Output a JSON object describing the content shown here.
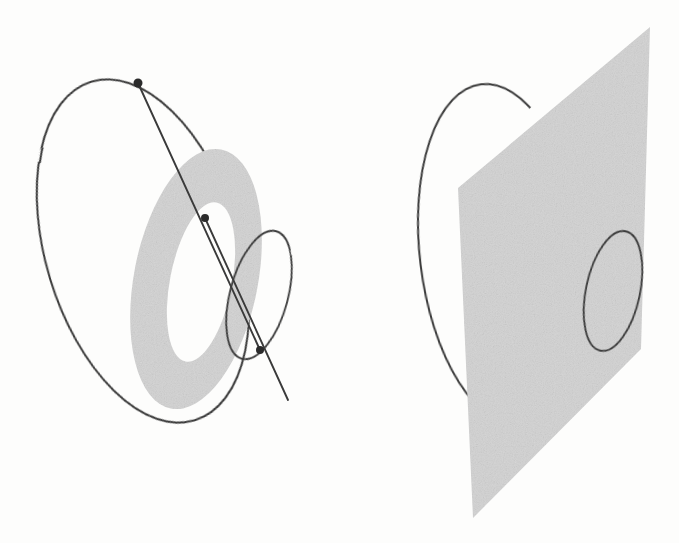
{
  "figure": {
    "background_color": "#fdfdfc",
    "stroke_color": "#3a3a3a",
    "fill_gray": "#d2d2d2",
    "fill_gray_edge": "#c9c9c9",
    "dot_color": "#2b2b2b",
    "canvas": {
      "width": 679,
      "height": 543
    }
  },
  "left_panel": {
    "label": "left-diagram",
    "outer_curve": {
      "name": "large-outer-ellipse",
      "cx": 143,
      "cy": 251,
      "rx": 97,
      "ry": 177,
      "rotation": -17,
      "stroke_width": 2.0
    },
    "annulus": {
      "name": "shaded-annulus",
      "outer": {
        "cx": 196,
        "cy": 279,
        "rx": 62,
        "ry": 132,
        "rotation": 11
      },
      "inner": {
        "cx": 201,
        "cy": 282,
        "rx": 31,
        "ry": 81,
        "rotation": 11
      },
      "fill": "#d2d2d2"
    },
    "small_ellipse": {
      "name": "small-right-ellipse",
      "cx": 259,
      "cy": 295,
      "rx": 29,
      "ry": 66,
      "rotation": 15,
      "stroke_width": 1.8
    },
    "chords": [
      {
        "name": "chord-upper",
        "x1": 138,
        "y1": 83,
        "x2": 260,
        "y2": 350
      },
      {
        "name": "chord-lower",
        "x1": 205,
        "y1": 218,
        "x2": 288,
        "y2": 400
      }
    ],
    "points": [
      {
        "name": "point-top",
        "cx": 138,
        "cy": 83,
        "r": 4.5
      },
      {
        "name": "point-center",
        "cx": 205,
        "cy": 218,
        "r": 4.0
      },
      {
        "name": "point-bottom-right",
        "cx": 260,
        "cy": 350,
        "r": 4.0
      }
    ]
  },
  "right_panel": {
    "label": "right-diagram",
    "outer_curve": {
      "name": "large-outer-ellipse",
      "cx": 502,
      "cy": 255,
      "rx": 82,
      "ry": 172,
      "rotation": -7,
      "stroke_width": 2.0
    },
    "plane": {
      "name": "shaded-plane",
      "points": "650,27 458,188 473,518 641,349",
      "fill": "#d2d2d2"
    },
    "small_ellipse": {
      "name": "small-plane-ellipse",
      "cx": 613,
      "cy": 291,
      "rx": 27,
      "ry": 61,
      "rotation": 12,
      "stroke_width": 1.8
    }
  }
}
